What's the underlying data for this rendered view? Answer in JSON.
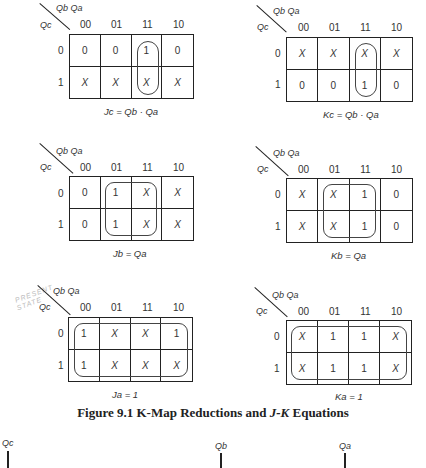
{
  "figure": {
    "caption_prefix": "Figure 9.1 K-Map Reductions and ",
    "caption_jk": "J-K",
    "caption_suffix": " Equations"
  },
  "axis": {
    "col_vars": "Qb Qa",
    "row_var": "Qc",
    "col_labels": [
      "00",
      "01",
      "11",
      "10"
    ],
    "row_labels": [
      "0",
      "1"
    ]
  },
  "maps": [
    {
      "id": "Jc",
      "equation": "Jc = Qb · Qa",
      "cells": [
        [
          "0",
          "0",
          "1",
          "0"
        ],
        [
          "X",
          "X",
          "X",
          "X"
        ]
      ],
      "grouping": "column 11, both rows"
    },
    {
      "id": "Kc",
      "equation": "Kc = Qb · Qa",
      "cells": [
        [
          "X",
          "X",
          "X",
          "X"
        ],
        [
          "0",
          "0",
          "1",
          "0"
        ]
      ],
      "grouping": "column 11, both rows"
    },
    {
      "id": "Jb",
      "equation": "Jb = Qa",
      "cells": [
        [
          "0",
          "1",
          "X",
          "X"
        ],
        [
          "0",
          "1",
          "X",
          "X"
        ]
      ],
      "grouping": "columns 01 and 11, both rows"
    },
    {
      "id": "Kb",
      "equation": "Kb = Qa",
      "cells": [
        [
          "X",
          "X",
          "1",
          "0"
        ],
        [
          "X",
          "X",
          "1",
          "0"
        ]
      ],
      "grouping": "columns 01 and 11, both rows"
    },
    {
      "id": "Ja",
      "equation": "Ja = 1",
      "cells": [
        [
          "1",
          "X",
          "X",
          "1"
        ],
        [
          "1",
          "X",
          "X",
          "X"
        ]
      ],
      "grouping": "all cells"
    },
    {
      "id": "Ka",
      "equation": "Ka = 1",
      "cells": [
        [
          "X",
          "1",
          "1",
          "X"
        ],
        [
          "X",
          "1",
          "1",
          "X"
        ]
      ],
      "grouping": "all cells"
    }
  ],
  "annotation": {
    "handwritten_line1": "PRESENT",
    "handwritten_line2": "STATE"
  },
  "bottom_signals": [
    "Qc",
    "Qb",
    "Qa"
  ]
}
